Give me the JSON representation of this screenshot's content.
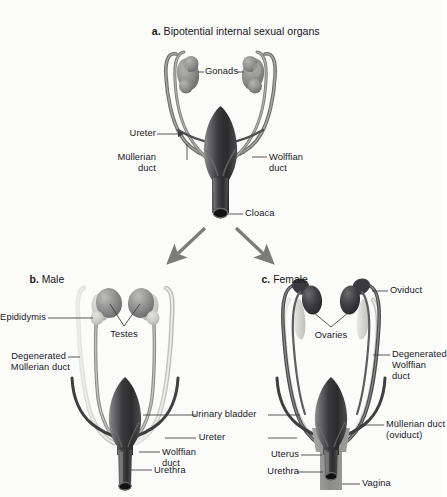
{
  "figure": {
    "background_color": "#fbfbfa",
    "ink_color": "#17171a",
    "palette": {
      "bladder_dark": "#4a4a4c",
      "bladder_darkest": "#242427",
      "duct_mid": "#8e8e8c",
      "duct_dark": "#454547",
      "duct_pale": "#d6d6d2",
      "gonad_mid": "#8d8d8b",
      "gonad_dark": "#3b3b3e",
      "arrow_gray": "#7b7b79",
      "leader_line": "#3a3a3c"
    }
  },
  "panel_a": {
    "marker": "a.",
    "title": "Bipotential internal sexual organs",
    "labels": {
      "gonads": "Gonads",
      "ureter": "Ureter",
      "mullerian_duct_line1": "Müllerian",
      "mullerian_duct_line2": "duct",
      "wolffian_duct_line1": "Wolffian",
      "wolffian_duct_line2": "duct",
      "cloaca": "Cloaca"
    }
  },
  "panel_b": {
    "marker": "b.",
    "title": "Male",
    "labels": {
      "epididymis": "Epididymis",
      "testes": "Testes",
      "degenerated_mullerian_line1": "Degenerated",
      "degenerated_mullerian_line2": "Müllerian duct",
      "wolffian_duct_line1": "Wolffian",
      "wolffian_duct_line2": "duct",
      "urethra": "Urethra"
    }
  },
  "panel_c": {
    "marker": "c.",
    "title": "Female",
    "labels": {
      "oviduct": "Oviduct",
      "ovaries": "Ovaries",
      "degenerated_wolffian_line1": "Degenerated",
      "degenerated_wolffian_line2": "Wolffian",
      "degenerated_wolffian_line3": "duct",
      "mullerian_duct_line1": "Müllerian duct",
      "mullerian_duct_line2": "(oviduct)",
      "uterus": "Uterus",
      "urethra": "Urethra",
      "vagina": "Vagina"
    }
  },
  "shared_labels": {
    "ureter": "Ureter",
    "urinary_bladder": "Urinary bladder"
  }
}
